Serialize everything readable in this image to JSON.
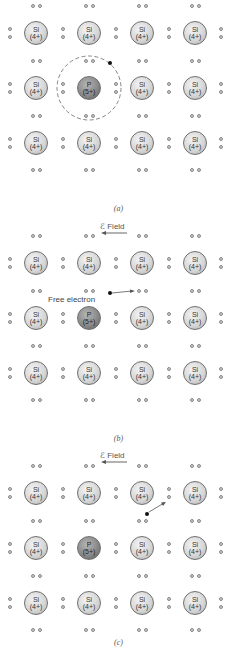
{
  "panels": [
    {
      "id": "a",
      "caption": "(a)",
      "field_label": null,
      "rows": [
        [
          "Si",
          "Si",
          "Si",
          "Si"
        ],
        [
          "Si",
          "P",
          "Si",
          "Si"
        ],
        [
          "Si",
          "Si",
          "Si",
          "Si"
        ]
      ],
      "annotation": "dashed orbit around P with loosely bound electron"
    },
    {
      "id": "b",
      "caption": "(b)",
      "field_label": "ℰ Field",
      "rows": [
        [
          "Si",
          "Si",
          "Si",
          "Si"
        ],
        [
          "Si",
          "P",
          "Si",
          "Si"
        ],
        [
          "Si",
          "Si",
          "Si",
          "Si"
        ]
      ],
      "annotation_label": "Free electron"
    },
    {
      "id": "c",
      "caption": "(c)",
      "field_label": "ℰ Field",
      "rows": [
        [
          "Si",
          "Si",
          "Si",
          "Si"
        ],
        [
          "Si",
          "P",
          "Si",
          "Si"
        ],
        [
          "Si",
          "Si",
          "Si",
          "Si"
        ]
      ]
    }
  ],
  "atoms": {
    "Si": {
      "symbol": "Si",
      "charge": "(4+)",
      "color": "#d4d4d4"
    },
    "P": {
      "symbol": "P",
      "charge": "(5+)",
      "color": "#8a8a8a"
    }
  },
  "labels": {
    "caption_a": "(a)",
    "caption_b": "(b)",
    "caption_c": "(c)",
    "field_b": "ℰ Field",
    "field_c": "ℰ Field",
    "free_electron": "Free electron"
  }
}
